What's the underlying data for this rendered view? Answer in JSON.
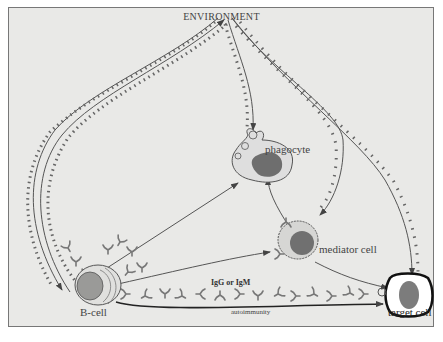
{
  "diagram": {
    "title": "ENVIRONMENT",
    "nodes": [
      {
        "id": "environment",
        "label": "ENVIRONMENT"
      },
      {
        "id": "phagocyte",
        "label": "phagocyte"
      },
      {
        "id": "mediator-cell",
        "label": "mediator cell"
      },
      {
        "id": "b-cell",
        "label": "B-cell"
      },
      {
        "id": "target-cell",
        "label": "target cell"
      }
    ],
    "edge_labels": {
      "antibodies": "IgG or IgM",
      "autoimmunity": "autoimmunity"
    },
    "edges": [
      {
        "from": "environment",
        "to": "b-cell",
        "note": "antigen path"
      },
      {
        "from": "b-cell",
        "to": "environment"
      },
      {
        "from": "environment",
        "to": "phagocyte"
      },
      {
        "from": "environment",
        "to": "mediator-cell"
      },
      {
        "from": "environment",
        "to": "target-cell"
      },
      {
        "from": "b-cell",
        "to": "phagocyte"
      },
      {
        "from": "b-cell",
        "to": "mediator-cell"
      },
      {
        "from": "b-cell",
        "to": "target-cell",
        "label": "IgG or IgM"
      },
      {
        "from": "b-cell",
        "to": "target-cell",
        "label": "autoimmunity"
      },
      {
        "from": "mediator-cell",
        "to": "phagocyte"
      },
      {
        "from": "mediator-cell",
        "to": "target-cell"
      }
    ]
  },
  "colors": {
    "background": "#e9e9e7",
    "line": "#555555",
    "cell_fill": "#dcdcda",
    "nucleus": "#6e6e6e",
    "target_fill": "#ffffff"
  }
}
